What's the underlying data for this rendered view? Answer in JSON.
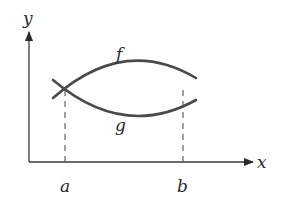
{
  "diagram": {
    "type": "area-between-curves",
    "axes": {
      "x_label": "x",
      "y_label": "y"
    },
    "curves": [
      {
        "name": "f",
        "position": "upper",
        "label": "f"
      },
      {
        "name": "g",
        "position": "lower",
        "label": "g"
      }
    ],
    "intersections": [
      {
        "label": "a"
      },
      {
        "label": "b"
      }
    ],
    "colors": {
      "curve": "#4a4a4a",
      "axis": "#3a3a3a",
      "dashed": "#555555",
      "background": "#ffffff"
    }
  }
}
